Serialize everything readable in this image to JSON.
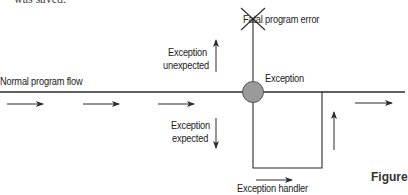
{
  "diagram": {
    "caption_fragment": "was saved.",
    "labels": {
      "normal_flow": "Normal program flow",
      "fatal_error": "Fatal program error",
      "exception": "Exception",
      "exception_unexpected_line1": "Exception",
      "exception_unexpected_line2": "unexpected",
      "exception_expected_line1": "Exception",
      "exception_expected_line2": "expected",
      "exception_handler": "Exception handler"
    },
    "figure_label": "Figure",
    "colors": {
      "line": "#2b2b2b",
      "node_fill": "#9a9a9a",
      "text": "#222222"
    }
  }
}
